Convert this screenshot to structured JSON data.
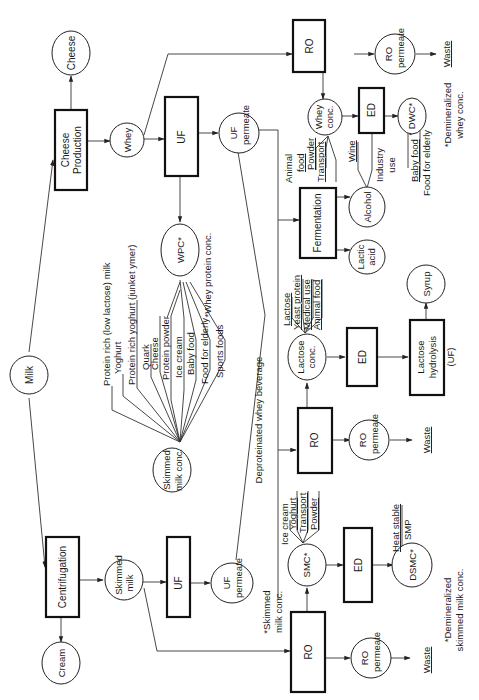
{
  "nodes": {
    "milk": "Milk",
    "cheese_production": [
      "Cheese",
      "Production"
    ],
    "cheese": "Cheese",
    "whey": "Whey",
    "uf_top": "UF",
    "uf_permeate_top": [
      "UF",
      "permeate"
    ],
    "wpc": "WPC*",
    "wpc_note": "*Whey protein conc.",
    "ro_top": "RO",
    "ro_permeate_top": [
      "RO",
      "permeate"
    ],
    "waste_top": "Waste",
    "whey_conc": [
      "Whey",
      "conc."
    ],
    "ed_top": "ED",
    "dwc": "DWC*",
    "dwc_note": [
      "*Demineralized",
      "whey conc."
    ],
    "fermentation": "Fermentation",
    "alcohol": "Alcohol",
    "lactic_acid": [
      "Lactic",
      "acid"
    ],
    "ro_mid": "RO",
    "ro_permeate_mid": [
      "RO",
      "permeate"
    ],
    "waste_mid": "Waste",
    "lactose_conc": [
      "Lactose",
      "conc."
    ],
    "ed_mid": "ED",
    "lactose_hydrolysis": [
      "Lactose",
      "hydrolysis",
      "(UF)"
    ],
    "syrup": "Syrup",
    "centrifugation": "Centrifugation",
    "cream": "Cream",
    "skimmed_milk": [
      "Skimmed",
      "milk"
    ],
    "uf_bottom": "UF",
    "uf_permeate_bottom": [
      "UF",
      "permeate"
    ],
    "skimmed_milk_conc": [
      "Skimmed",
      "milk conc."
    ],
    "ro_bottom": "RO",
    "ro_permeate_bottom": [
      "RO",
      "permeate"
    ],
    "waste_bottom": "Waste",
    "smc": "SMC*",
    "smc_note": [
      "*Skimmed",
      "milk conc."
    ],
    "ed_bottom": "ED",
    "dsmc": "DSMC*",
    "dsmc_note": [
      "*Demineralized",
      "skimmed milk conc."
    ],
    "deproteinated": "Deproteinated whey beverage"
  },
  "products": {
    "whey_conc": [
      "Animal",
      "food",
      "Powder",
      "Transport"
    ],
    "alcohol": [
      "Wine",
      "Industry",
      "use"
    ],
    "dwc": [
      "Baby food",
      "Food for elderly"
    ],
    "lactose_conc": [
      "Lactose",
      "Yeast protein",
      "Medical use",
      "Animal food"
    ],
    "skimmed_milk_conc": [
      "Protein rich (low lactose) milk",
      "Yoghurt",
      "Protein rich yoghurt (junket ymer)",
      "Quark",
      "Cheese",
      "Protein powder",
      "Ice cream",
      "Baby food",
      "Food for elderly",
      "Sports foods"
    ],
    "smc": [
      "Ice cream",
      "Yoghurt",
      "Transport",
      "Powder"
    ],
    "dsmc": [
      "Heat stable",
      "SMP"
    ]
  }
}
